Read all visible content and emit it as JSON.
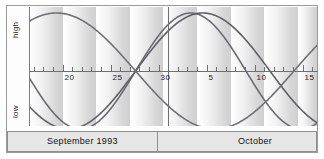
{
  "chart_data": {
    "type": "line",
    "title": "",
    "subtitle": "",
    "xlabel": "",
    "ylabel": "",
    "ylim": [
      -1,
      1
    ],
    "xlim": [
      16.5,
      46.5
    ],
    "grid": false,
    "legend_position": "none",
    "x_axis": {
      "tick_labels": [
        "20",
        "25",
        "30",
        "5",
        "10",
        "15"
      ],
      "tick_values": [
        20,
        25,
        30,
        35,
        40,
        45
      ],
      "minor_tick_interval": 1,
      "note": "day-of-month; 31 = Sep 30 boundary, values 35/40/45 render as Oct 5/10/15"
    },
    "y_axis": {
      "high_label": "high",
      "low_label": "low",
      "zero_line": true
    },
    "series": [
      {
        "name": "physical",
        "period_days": 23,
        "color": "#6b6b78",
        "zero_crossing_ascending_day": 27.6,
        "values_note": "sine; peak Sep 33.4-ish, trough before crossing"
      },
      {
        "name": "emotional",
        "period_days": 28,
        "color": "#5f5f6c",
        "zero_crossing_ascending_day": 27.6,
        "values_note": "sine; broader peak early October"
      },
      {
        "name": "intellectual",
        "period_days": 33,
        "color": "#70707c",
        "zero_crossing_descending_day": 27.6,
        "values_note": "inverted sine; high at left edge, descends through crossing"
      }
    ],
    "shading": {
      "type": "weekly-gradient-bands",
      "band_width_days": 3.5,
      "from_color": "#ffffff",
      "to_color": "#cfcfcf"
    },
    "annotations": {
      "month_divider_day": 31
    }
  },
  "footer": {
    "left_period": "September 1993",
    "right_period": "October"
  },
  "colors": {
    "frame": "#9a9a9a",
    "axis": "#6f6f6f",
    "footer_background": "#e6e6e6",
    "curve": "#66666f"
  }
}
